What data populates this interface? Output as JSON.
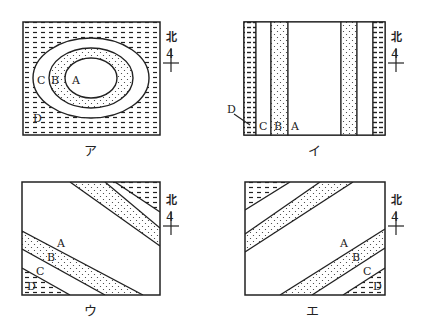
{
  "diagrams": [
    {
      "id": "a",
      "caption": "ア",
      "pattern": "concentric-ellipses",
      "layers": [
        "A",
        "B",
        "C",
        "D"
      ]
    },
    {
      "id": "i",
      "caption": "イ",
      "pattern": "vertical-bands",
      "layers": [
        "A",
        "B",
        "C",
        "D"
      ]
    },
    {
      "id": "u",
      "caption": "ウ",
      "pattern": "diagonal-bands-nw-se",
      "layers": [
        "A",
        "B",
        "C",
        "D"
      ]
    },
    {
      "id": "e",
      "caption": "エ",
      "pattern": "diagonal-bands-sw-ne",
      "layers": [
        "A",
        "B",
        "C",
        "D"
      ]
    }
  ],
  "north_label": "北",
  "legend": {
    "A": "blank",
    "B": "dotted",
    "C": "blank",
    "D": "dashed-hatch"
  }
}
